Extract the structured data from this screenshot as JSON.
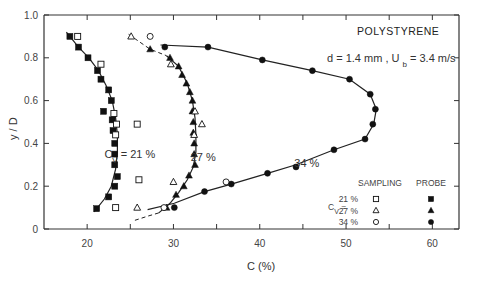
{
  "chart_data": {
    "type": "scatter",
    "title": "POLYSTYRENE",
    "subtitle": "d = 1.4 mm ,  U_b = 3.4 m/s",
    "xlabel": "C (%)",
    "ylabel": "y / D",
    "xlim": [
      15,
      63
    ],
    "ylim": [
      0,
      1.0
    ],
    "x_ticks": [
      20,
      30,
      40,
      50,
      60
    ],
    "y_ticks": [
      0,
      0.2,
      0.4,
      0.6,
      0.8,
      1.0
    ],
    "y_tick_labels": [
      "0",
      "0.2",
      "0.4",
      "0.6",
      "0.8",
      "1.0"
    ],
    "grid": false,
    "annotations": [
      {
        "text": "C",
        "sub": "V",
        "rest": " =  21 %",
        "x": 22,
        "y": 0.33
      },
      {
        "text": "27 %",
        "x": 32,
        "y": 0.32
      },
      {
        "text": "34 %",
        "x": 44,
        "y": 0.29
      }
    ],
    "legend": {
      "position": "lower right",
      "header_sampling": "SAMPLING",
      "header_probe": "PROBE",
      "cv_label": "C",
      "cv_sub": "V",
      "rows": [
        "21 %",
        "27 %",
        "34 %"
      ]
    },
    "series": [
      {
        "name": "Cv=21% Probe",
        "marker": "filled-square",
        "points": [
          [
            18.0,
            0.9
          ],
          [
            19.0,
            0.85
          ],
          [
            20.1,
            0.8
          ],
          [
            21.2,
            0.74
          ],
          [
            21.6,
            0.7
          ],
          [
            22.5,
            0.65
          ],
          [
            22.8,
            0.6
          ],
          [
            21.9,
            0.55
          ],
          [
            22.9,
            0.51
          ],
          [
            23.0,
            0.46
          ],
          [
            23.2,
            0.4
          ],
          [
            23.2,
            0.35
          ],
          [
            23.2,
            0.3
          ],
          [
            23.5,
            0.245
          ],
          [
            23.2,
            0.2
          ],
          [
            22.5,
            0.15
          ],
          [
            21.1,
            0.095
          ]
        ]
      },
      {
        "name": "Cv=21% Sampling",
        "marker": "open-square",
        "points": [
          [
            18.9,
            0.9
          ],
          [
            21.6,
            0.77
          ],
          [
            23.1,
            0.54
          ],
          [
            23.4,
            0.49
          ],
          [
            25.8,
            0.49
          ],
          [
            23.3,
            0.44
          ],
          [
            26.0,
            0.23
          ],
          [
            23.3,
            0.1
          ]
        ]
      },
      {
        "name": "Cv=27% Probe",
        "marker": "filled-triangle",
        "points": [
          [
            27.3,
            0.84
          ],
          [
            29.6,
            0.8
          ],
          [
            30.6,
            0.76
          ],
          [
            31.0,
            0.72
          ],
          [
            31.5,
            0.68
          ],
          [
            31.9,
            0.64
          ],
          [
            32.2,
            0.6
          ],
          [
            32.2,
            0.55
          ],
          [
            32.3,
            0.5
          ],
          [
            32.3,
            0.45
          ],
          [
            32.4,
            0.4
          ],
          [
            32.4,
            0.35
          ],
          [
            32.5,
            0.3
          ],
          [
            31.8,
            0.25
          ],
          [
            31.2,
            0.2
          ],
          [
            30.3,
            0.16
          ],
          [
            29.2,
            0.1
          ]
        ]
      },
      {
        "name": "Cv=27% Sampling",
        "marker": "open-triangle",
        "points": [
          [
            25.1,
            0.9
          ],
          [
            29.7,
            0.77
          ],
          [
            32.5,
            0.55
          ],
          [
            33.3,
            0.49
          ],
          [
            32.4,
            0.44
          ],
          [
            30.0,
            0.22
          ],
          [
            25.8,
            0.1
          ]
        ]
      },
      {
        "name": "Cv=34% Probe",
        "marker": "filled-circle",
        "points": [
          [
            29.0,
            0.85
          ],
          [
            34.0,
            0.85
          ],
          [
            40.3,
            0.79
          ],
          [
            46.1,
            0.74
          ],
          [
            50.4,
            0.7
          ],
          [
            52.8,
            0.63
          ],
          [
            53.4,
            0.56
          ],
          [
            53.1,
            0.49
          ],
          [
            52.2,
            0.42
          ],
          [
            48.6,
            0.37
          ],
          [
            44.2,
            0.29
          ],
          [
            40.9,
            0.26
          ],
          [
            36.7,
            0.21
          ],
          [
            33.6,
            0.175
          ],
          [
            30.1,
            0.1
          ]
        ]
      },
      {
        "name": "Cv=34% Sampling",
        "marker": "open-circle",
        "points": [
          [
            27.3,
            0.9
          ],
          [
            36.1,
            0.22
          ],
          [
            28.9,
            0.1
          ]
        ]
      }
    ]
  }
}
